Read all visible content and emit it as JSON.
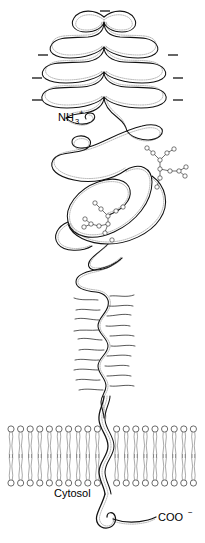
{
  "figure": {
    "background_color": "#ffffff",
    "ink_color": "#111111",
    "width": 205,
    "height": 543
  },
  "labels": {
    "n_terminus": {
      "text": "NH",
      "subscript": "3",
      "superscript": "+",
      "full": "NH3+",
      "x": 58,
      "y": 121
    },
    "c_terminus": {
      "text": "COO",
      "superscript": "−",
      "full": "COO−",
      "x": 158,
      "y": 521
    },
    "cytosol": {
      "text": "Cytosol",
      "x": 54,
      "y": 497
    }
  },
  "charge_marks": {
    "symbol": "–",
    "count": 7,
    "positions": [
      {
        "x": 101,
        "y": 11,
        "side": "top"
      },
      {
        "x": 39,
        "y": 54,
        "side": "left"
      },
      {
        "x": 39,
        "y": 77,
        "side": "left"
      },
      {
        "x": 39,
        "y": 99,
        "side": "left"
      },
      {
        "x": 170,
        "y": 54,
        "side": "right"
      },
      {
        "x": 170,
        "y": 77,
        "side": "right"
      },
      {
        "x": 170,
        "y": 99,
        "side": "right"
      }
    ]
  },
  "regions": [
    {
      "name": "folded-hairpin-domain",
      "description": "tightly folded serpentine ribbon domain at the N-terminal end",
      "y_range": [
        14,
        128
      ]
    },
    {
      "name": "globular-looped-domain",
      "description": "large open coiled loops bearing N-linked oligosaccharides",
      "y_range": [
        128,
        252
      ]
    },
    {
      "name": "bristle-stalk-domain",
      "description": "extended wavy stalk densely decorated with short O-linked sugar bristles",
      "y_range": [
        252,
        400
      ]
    },
    {
      "name": "transmembrane-segment",
      "description": "single alpha-helical segment crossing the lipid bilayer",
      "y_range": [
        400,
        492
      ]
    },
    {
      "name": "cytoplasmic-tail",
      "description": "short hooked cytoplasmic tail ending in the carboxyl terminus",
      "y_range": [
        492,
        535
      ]
    }
  ],
  "glycans": [
    {
      "name": "n-linked-glycan-right",
      "type": "branched oligosaccharide",
      "residue_count": 11,
      "anchor": {
        "x": 160,
        "y": 180
      }
    },
    {
      "name": "n-linked-glycan-center",
      "type": "branched oligosaccharide",
      "residue_count": 12,
      "anchor": {
        "x": 105,
        "y": 228
      }
    }
  ],
  "membrane": {
    "name": "lipid-bilayer",
    "x_start": 9,
    "x_end": 198,
    "upper_leaflet_head_y": 429,
    "lower_leaflet_head_y": 483,
    "lipid_count_per_leaflet": 19,
    "head_shape": "circle",
    "tail_count": 2
  }
}
